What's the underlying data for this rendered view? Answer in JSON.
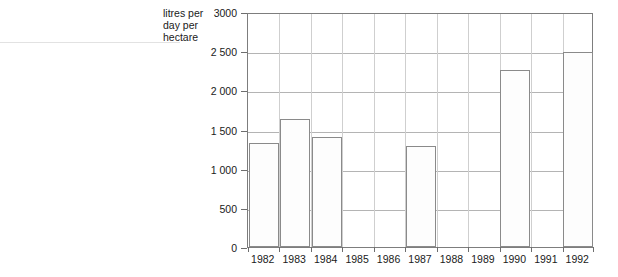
{
  "chart_data": {
    "type": "bar",
    "title": "",
    "subtitle": "",
    "xlabel": "",
    "ylabel": "litres per\nday per\nhectare",
    "ylabel_lines": [
      "litres per",
      "day per",
      "hectare"
    ],
    "categories": [
      "1982",
      "1983",
      "1984",
      "1985",
      "1986",
      "1987",
      "1988",
      "1989",
      "1990",
      "1991",
      "1992"
    ],
    "values": [
      1330,
      1640,
      1410,
      null,
      null,
      1290,
      null,
      null,
      2260,
      null,
      2490
    ],
    "ylim": [
      0,
      3000
    ],
    "yticks": [
      0,
      500,
      1000,
      1500,
      2000,
      2500,
      3000
    ],
    "ytick_labels": [
      "0",
      "500",
      "1 000",
      "1 500",
      "2 000",
      "2 500",
      "3000"
    ],
    "grid": true,
    "grid_axis": "y",
    "legend": false,
    "legend_position": "none",
    "bar_fill_color": "#fdfdfd",
    "bar_edge_color": "#8a8a8a",
    "grid_color": "#b4b4b4",
    "axis_color": "#7d7d7d",
    "text_color": "#1a1a1a",
    "missing_categories": [
      "1985",
      "1986",
      "1988",
      "1989",
      "1991"
    ]
  }
}
